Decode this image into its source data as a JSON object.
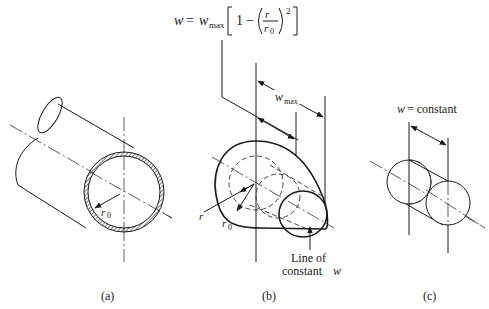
{
  "formula": {
    "lhs": "w",
    "eq": "=",
    "wmax_base": "w",
    "wmax_sub": "max",
    "one": "1",
    "minus": "−",
    "r": "r",
    "r0_base": "r",
    "r0_sub": "0",
    "exponent": "2"
  },
  "panel_a": {
    "radius_label_base": "r",
    "radius_label_sub": "0",
    "caption": "(a)"
  },
  "panel_b": {
    "wmax_base": "w",
    "wmax_sub": "max",
    "r_label": "r",
    "r0_base": "r",
    "r0_sub": "0",
    "line_label_1": "Line of",
    "line_label_2": "constant",
    "line_label_w": "w",
    "caption": "(b)"
  },
  "panel_c": {
    "title_w": "w",
    "title_rest": "= constant",
    "caption": "(c)"
  }
}
